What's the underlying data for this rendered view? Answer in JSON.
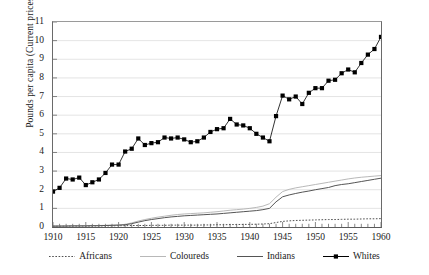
{
  "chart_data": {
    "type": "line",
    "title": "",
    "xlabel": "",
    "ylabel": "Pounds per capita (Current prices)",
    "xlim": [
      1910,
      1960
    ],
    "ylim": [
      0,
      11
    ],
    "grid": true,
    "legend_position": "bottom",
    "y_ticks": [
      "0",
      "1",
      "2",
      "3",
      "4",
      "5",
      "6",
      "7",
      "8",
      "9",
      "10",
      "11"
    ],
    "x_ticks": [
      "1910",
      "1915",
      "1920",
      "1925",
      "1930",
      "1935",
      "1940",
      "1945",
      "1950",
      "1955",
      "1960"
    ],
    "x_minor_tick_interval": 1,
    "x": [
      1910,
      1911,
      1912,
      1913,
      1914,
      1915,
      1916,
      1917,
      1918,
      1919,
      1920,
      1921,
      1922,
      1923,
      1924,
      1925,
      1926,
      1927,
      1928,
      1929,
      1930,
      1931,
      1932,
      1933,
      1934,
      1935,
      1936,
      1937,
      1938,
      1939,
      1940,
      1941,
      1942,
      1943,
      1944,
      1945,
      1946,
      1947,
      1948,
      1949,
      1950,
      1951,
      1952,
      1953,
      1954,
      1955,
      1956,
      1957,
      1958,
      1959,
      1960
    ],
    "series": [
      {
        "name": "Africans",
        "style": "dotted",
        "color": "#3c3c3c",
        "marker": "none",
        "values": [
          0.04,
          0.04,
          0.05,
          0.05,
          0.05,
          0.05,
          0.05,
          0.06,
          0.06,
          0.06,
          0.07,
          0.07,
          0.08,
          0.08,
          0.08,
          0.09,
          0.09,
          0.09,
          0.1,
          0.1,
          0.1,
          0.1,
          0.1,
          0.11,
          0.11,
          0.12,
          0.12,
          0.13,
          0.13,
          0.14,
          0.14,
          0.15,
          0.16,
          0.18,
          0.24,
          0.3,
          0.33,
          0.35,
          0.36,
          0.37,
          0.38,
          0.39,
          0.4,
          0.4,
          0.41,
          0.42,
          0.42,
          0.43,
          0.44,
          0.44,
          0.45
        ]
      },
      {
        "name": "Coloureds",
        "style": "solid-light",
        "color": "#b0b0b0",
        "marker": "none",
        "values": [
          0.05,
          0.05,
          0.06,
          0.06,
          0.06,
          0.07,
          0.07,
          0.08,
          0.09,
          0.1,
          0.11,
          0.14,
          0.22,
          0.32,
          0.4,
          0.47,
          0.53,
          0.58,
          0.63,
          0.67,
          0.7,
          0.72,
          0.74,
          0.76,
          0.79,
          0.82,
          0.86,
          0.9,
          0.93,
          0.96,
          1.0,
          1.05,
          1.12,
          1.25,
          1.6,
          1.9,
          2.02,
          2.1,
          2.16,
          2.22,
          2.28,
          2.34,
          2.4,
          2.46,
          2.52,
          2.58,
          2.63,
          2.67,
          2.7,
          2.73,
          2.76
        ]
      },
      {
        "name": "Indians",
        "style": "solid-dark",
        "color": "#555555",
        "marker": "none",
        "values": [
          0.05,
          0.05,
          0.05,
          0.06,
          0.06,
          0.06,
          0.07,
          0.07,
          0.08,
          0.09,
          0.1,
          0.12,
          0.18,
          0.26,
          0.34,
          0.4,
          0.45,
          0.5,
          0.54,
          0.57,
          0.6,
          0.62,
          0.64,
          0.66,
          0.68,
          0.7,
          0.73,
          0.76,
          0.79,
          0.82,
          0.85,
          0.88,
          0.93,
          1.0,
          1.35,
          1.62,
          1.72,
          1.8,
          1.87,
          1.93,
          2.0,
          2.06,
          2.12,
          2.22,
          2.28,
          2.32,
          2.38,
          2.44,
          2.5,
          2.56,
          2.62
        ]
      },
      {
        "name": "Whites",
        "style": "solid-marker",
        "color": "#000000",
        "marker": "square",
        "values": [
          1.9,
          2.1,
          2.6,
          2.55,
          2.65,
          2.25,
          2.4,
          2.55,
          2.9,
          3.35,
          3.35,
          4.05,
          4.2,
          4.75,
          4.4,
          4.5,
          4.55,
          4.8,
          4.75,
          4.8,
          4.7,
          4.55,
          4.6,
          4.8,
          5.1,
          5.25,
          5.3,
          5.8,
          5.5,
          5.45,
          5.3,
          5.0,
          4.8,
          4.6,
          5.95,
          7.05,
          6.85,
          7.0,
          6.6,
          7.2,
          7.45,
          7.45,
          7.85,
          7.9,
          8.25,
          8.45,
          8.3,
          8.8,
          9.25,
          9.55,
          10.2
        ]
      }
    ]
  },
  "legend": {
    "items": [
      {
        "label": "Africans"
      },
      {
        "label": "Coloureds"
      },
      {
        "label": "Indians"
      },
      {
        "label": "Whites"
      }
    ]
  }
}
